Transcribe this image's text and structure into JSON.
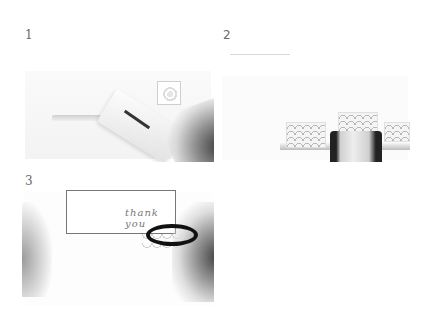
{
  "panels": [
    {
      "step": "1",
      "description": "Insert paper strip into border punch"
    },
    {
      "step": "2",
      "description": "Punch repeating scallop pattern along strip"
    },
    {
      "step": "3",
      "description": "Trim card edge with scissors",
      "card_text": "thank you"
    }
  ]
}
